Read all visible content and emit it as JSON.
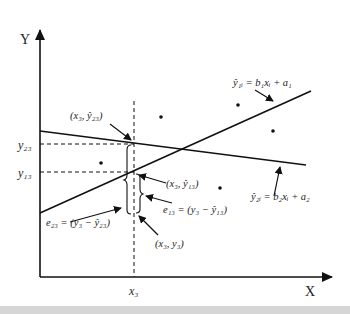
{
  "axes": {
    "y_label": "Y",
    "x_label": "X",
    "x_tick": "x₃",
    "y_ticks": [
      "y₂₃",
      "y₁₃"
    ]
  },
  "lines": [
    {
      "id": "line1",
      "equation": "ŷ₁ᵢ = b₁xᵢ + a₁"
    },
    {
      "id": "line2",
      "equation": "ŷ₂ᵢ = b₂xᵢ + a₂"
    }
  ],
  "annotations": {
    "point_yhat23": "(x₃, ŷ₂₃)",
    "point_yhat13": "(x₃, ŷ₁₃)",
    "point_y3": "(x₃, y₃)",
    "error_23": "e₂₃ = (y₃ − ŷ₂₃)",
    "error_13": "e₁₃ = (y₃ − ŷ₁₃)"
  },
  "scatter_point_count": 5
}
